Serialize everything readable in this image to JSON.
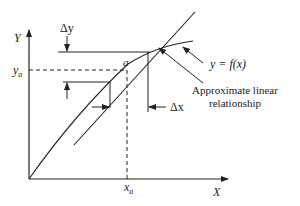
{
  "diagram": {
    "axes": {
      "x_label": "X",
      "y_label": "Y"
    },
    "point": {
      "label": "a",
      "x_label": "x",
      "x_sub": "a",
      "y_label": "y",
      "y_sub": "a"
    },
    "deltas": {
      "dy_label": "Δy",
      "dx_label": "Δx"
    },
    "annotations": {
      "curve_label": "y = f(x)",
      "linear_label_line1": "Approximate linear",
      "linear_label_line2": "relationship"
    },
    "colors": {
      "stroke": "#222222",
      "background": "#ffffff"
    }
  }
}
